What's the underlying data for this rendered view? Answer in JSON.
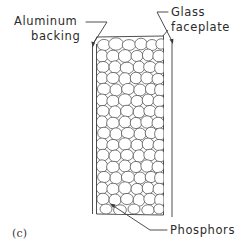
{
  "figure": {
    "caption": "(c)",
    "title_note": "Cross-section of a CRT screen"
  },
  "labels": {
    "aluminum_line1": "Aluminum",
    "aluminum_line2": "backing",
    "glass_line1": "Glass",
    "glass_line2": "faceplate",
    "phosphors": "Phosphors"
  },
  "icons": {
    "aluminum_leader": "leader-line-arrow-icon",
    "glass_leader": "leader-line-arrow-icon",
    "phosphors_leader": "leader-line-arrow-icon"
  },
  "colors": {
    "ink": "#3a3a3a",
    "grain_stroke": "#4a4a4a",
    "background": "#ffffff",
    "grain_fill": "#ffffff"
  },
  "structure": {
    "aluminum_backing_label": "aluminum-backing-layer",
    "phosphor_layer_label": "phosphor-granule-layer",
    "glass_faceplate_label": "glass-faceplate-layer"
  }
}
